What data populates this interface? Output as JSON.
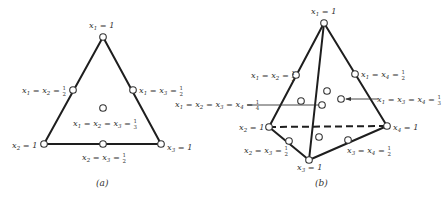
{
  "figure": {
    "panel_a": {
      "caption": "(a)",
      "vertices": [
        {
          "id": "x1",
          "label": "x1 = 1"
        },
        {
          "id": "x2",
          "label": "x2 = 1"
        },
        {
          "id": "x3",
          "label": "x3 = 1"
        }
      ],
      "midpoints": [
        {
          "label": "x1 = x2 = 1/2"
        },
        {
          "label": "x1 = x3 = 1/2"
        },
        {
          "label": "x2 = x3 = 1/2"
        }
      ],
      "centroid": {
        "label": "x1 = x2 = x3 = 1/3"
      }
    },
    "panel_b": {
      "caption": "(b)",
      "vertices": [
        {
          "id": "x1",
          "label": "x1 = 1"
        },
        {
          "id": "x2",
          "label": "x2 = 1"
        },
        {
          "id": "x3",
          "label": "x3 = 1"
        },
        {
          "id": "x4",
          "label": "x4 = 1"
        }
      ],
      "midpoints": [
        {
          "label": "x1 = x2 = 1/2"
        },
        {
          "label": "x1 = x4 = 1/2"
        },
        {
          "label": "x2 = x3 = 1/2"
        },
        {
          "label": "x3 = x4 = 1/2"
        }
      ],
      "centroid": {
        "label": "x1 = x2 = x3 = x4 = 1/4"
      },
      "face_centroid": {
        "label": "x1 = x3 = x4 = 1/3"
      }
    }
  }
}
